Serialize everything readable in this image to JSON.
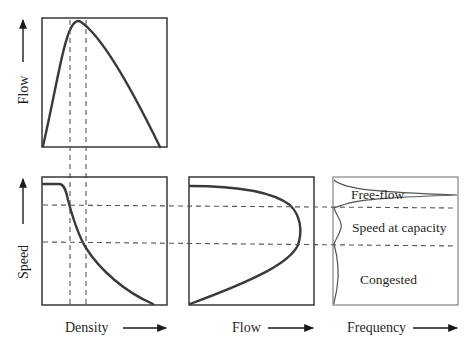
{
  "diagram": {
    "panels": {
      "flow_density": {
        "ylabel": "Flow",
        "xlabel": "",
        "curve": "parabolic flow-density relationship peaking near capacity"
      },
      "speed_density": {
        "ylabel": "Speed",
        "xlabel": "Density",
        "curve": "speed decreases from free-flow speed as density increases"
      },
      "speed_flow": {
        "xlabel": "Flow",
        "curve": "backward-bending speed-flow curve"
      },
      "speed_frequency": {
        "xlabel": "Frequency",
        "regions": [
          {
            "label": "Free-flow"
          },
          {
            "label": "Speed at capacity"
          },
          {
            "label": "Congested"
          }
        ]
      }
    },
    "colors": {
      "line": "#3a3a3a",
      "dash": "#555555",
      "background": "#ffffff"
    }
  }
}
